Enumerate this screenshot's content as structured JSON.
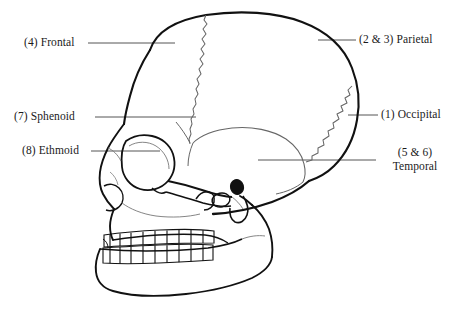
{
  "figure": {
    "width": 460,
    "height": 316,
    "background_color": "#ffffff",
    "ink_color": "#1a1a1a",
    "leader_line_color": "#555555"
  },
  "labels": [
    {
      "id": "frontal",
      "number": "(4)",
      "name": "Frontal",
      "text": "(4) Frontal",
      "side": "left",
      "lines": [
        "(4) Frontal"
      ]
    },
    {
      "id": "sphenoid",
      "number": "(7)",
      "name": "Sphenoid",
      "text": "(7) Sphenoid",
      "side": "left",
      "lines": [
        "(7) Sphenoid"
      ]
    },
    {
      "id": "ethmoid",
      "number": "(8)",
      "name": "Ethmoid",
      "text": "(8) Ethmoid",
      "side": "left",
      "lines": [
        "(8) Ethmoid"
      ]
    },
    {
      "id": "parietal",
      "number": "(2 & 3)",
      "name": "Parietal",
      "text": "(2 & 3) Parietal",
      "side": "right",
      "lines": [
        "(2 & 3) Parietal"
      ]
    },
    {
      "id": "occipital",
      "number": "(1)",
      "name": "Occipital",
      "text": "(1) Occipital",
      "side": "right",
      "lines": [
        "(1) Occipital"
      ]
    },
    {
      "id": "temporal",
      "number": "(5 & 6)",
      "name": "Temporal",
      "text": "(5 & 6) Temporal",
      "side": "right",
      "lines": [
        "(5 & 6)",
        "Temporal"
      ]
    }
  ],
  "label_text": {
    "frontal": "(4) Frontal",
    "sphenoid": "(7) Sphenoid",
    "ethmoid": "(8) Ethmoid",
    "parietal": "(2 & 3) Parietal",
    "occipital": "(1) Occipital",
    "temporal_line1": "(5 & 6)",
    "temporal_line2": "Temporal"
  }
}
